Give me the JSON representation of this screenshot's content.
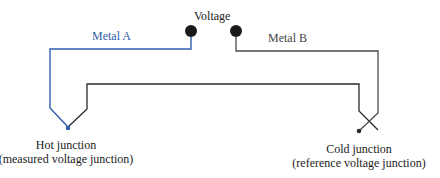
{
  "labels": {
    "voltage": "Voltage",
    "metal_a": "Metal A",
    "metal_b": "Metal B",
    "hot_junction": "Hot junction",
    "hot_junction_sub": "(measured voltage junction)",
    "cold_junction": "Cold junction",
    "cold_junction_sub": "(reference voltage junction)"
  },
  "colors": {
    "metal_a": "#2f5fa8",
    "metal_b": "#4a4a4a",
    "inner_wire": "#2a2a2a",
    "terminal": "#1a1a1a"
  },
  "components": {
    "terminals": [
      "left-voltage-terminal",
      "right-voltage-terminal"
    ],
    "junctions": [
      "hot-junction",
      "cold-junction"
    ],
    "wires": [
      "metal-a-wire",
      "metal-b-wire",
      "connecting-wire"
    ]
  }
}
